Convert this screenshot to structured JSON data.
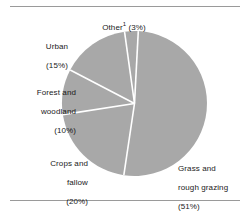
{
  "chart_data": {
    "type": "pie",
    "title": "",
    "subtitle": "",
    "xlabel": "",
    "ylabel": "",
    "legend_position": "none",
    "grid": false,
    "slice_color": "#a8a8a8",
    "separator_color": "#ffffff",
    "categories": [
      "Grass and rough grazing",
      "Crops and fallow",
      "Forest and woodland",
      "Urban",
      "Other"
    ],
    "values": [
      51,
      20,
      10,
      15,
      3
    ],
    "slices": [
      {
        "name": "Grass and rough grazing",
        "value": 51,
        "label_line1": "Grass and",
        "label_line2": "rough grazing",
        "label_percent": "(51%)",
        "footnote_marker": ""
      },
      {
        "name": "Crops and fallow",
        "value": 20,
        "label_line1": "Crops and",
        "label_line2": "fallow",
        "label_percent": "(20%)",
        "footnote_marker": ""
      },
      {
        "name": "Forest and woodland",
        "value": 10,
        "label_line1": "Forest and",
        "label_line2": "woodland",
        "label_percent": "(10%)",
        "footnote_marker": ""
      },
      {
        "name": "Urban",
        "value": 15,
        "label_line1": "Urban",
        "label_line2": "",
        "label_percent": "(15%)",
        "footnote_marker": ""
      },
      {
        "name": "Other",
        "value": 3,
        "label_line1": "Other",
        "label_line2": "",
        "label_percent": "(3%)",
        "footnote_marker": "1"
      }
    ]
  },
  "labels": {
    "other": {
      "text": "Other",
      "marker": "1",
      "percent": " (3%)"
    },
    "urban": {
      "line1": "Urban",
      "percent": "(15%)"
    },
    "forest": {
      "line1": "Forest and",
      "line2": "woodland",
      "percent": "(10%)"
    },
    "crops": {
      "line1": "Crops and",
      "line2": "fallow",
      "percent": "(20%)"
    },
    "grass": {
      "line1": "Grass and",
      "line2": "rough grazing",
      "percent": "(51%)"
    }
  }
}
